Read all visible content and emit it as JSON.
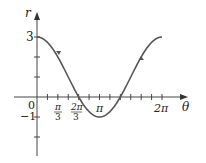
{
  "chart_data": {
    "type": "line",
    "title": "",
    "function": "r = 1 + 2cos(theta)",
    "xlabel": "θ",
    "ylabel": "r",
    "xlim": [
      0,
      6.2832
    ],
    "ylim": [
      -2.5,
      3.8
    ],
    "grid": false,
    "legend": null,
    "x_ticks_every": "π/6",
    "x_tick_labels": [
      "0",
      "π/3",
      "2π/3",
      "π",
      "2π"
    ],
    "y_tick_values": [
      -2,
      -1,
      1,
      2,
      3
    ],
    "y_tick_labels": [
      "3",
      "-1"
    ],
    "series": [
      {
        "name": "r = 1 + 2cos θ",
        "color": "#555555",
        "x": [
          0,
          0.5236,
          1.0472,
          1.5708,
          2.0944,
          2.618,
          3.1416,
          3.6652,
          4.1888,
          4.7124,
          5.236,
          5.7596,
          6.2832
        ],
        "values": [
          3,
          2.732,
          2,
          1,
          0,
          -0.732,
          -1,
          -0.732,
          0,
          1,
          2,
          2.732,
          3
        ]
      }
    ]
  },
  "labels": {
    "r_axis": "r",
    "theta_axis": "θ",
    "origin": "0",
    "three": "3",
    "minus_one": "−1",
    "pi_over_3_num": "π",
    "pi_over_3_den": "3",
    "two_pi_over_3_num": "2π",
    "two_pi_over_3_den": "3",
    "pi": "π",
    "two_pi": "2π"
  }
}
